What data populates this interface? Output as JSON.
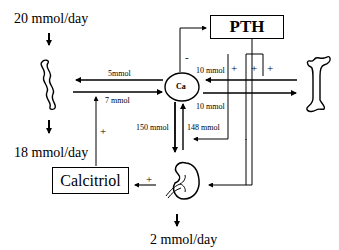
{
  "diagram": {
    "intake_label": "20 mmol/day",
    "fecal_label": "18 mmol/day",
    "urine_label": "2 mmol/day",
    "pth_label": "PTH",
    "calcitriol_label": "Calcitriol",
    "ca_label": "Ca",
    "gut_to_ca": "7 mmol",
    "ca_to_gut": "5mmol",
    "bone_to_ca": "10 mmol",
    "ca_to_bone": "10 mmol",
    "ca_to_kidney": "150 mmol",
    "kidney_to_ca": "148 mmol",
    "ca_inhibits_pth": "-",
    "pth_bone_plus_1": "+",
    "pth_bone_plus_2": "+",
    "pth_bone_plus_3": "+",
    "calcitriol_gut_plus": "+",
    "kidney_calcitriol_plus": "+",
    "icons": {
      "gut": "intestine-icon",
      "bone": "bone-icon",
      "kidney": "kidney-icon"
    },
    "colors": {
      "line": "#000000",
      "background": "#ffffff"
    }
  }
}
